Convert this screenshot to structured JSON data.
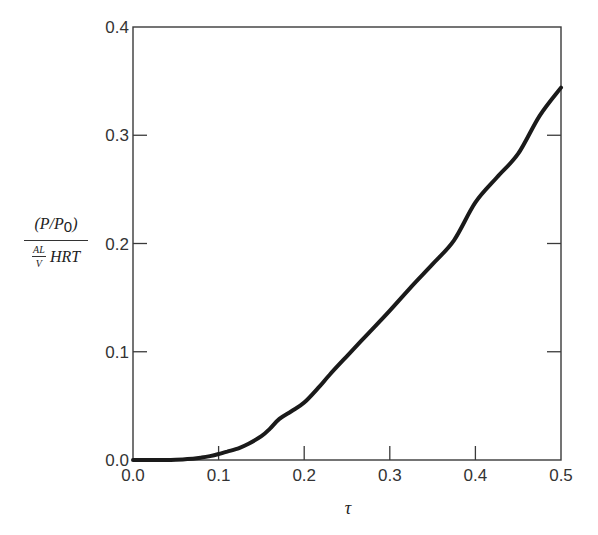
{
  "chart_data": {
    "type": "line",
    "title": "",
    "xlabel": "τ",
    "ylabel": {
      "numerator": "(P/P0)",
      "numerator_main": "(P/P",
      "numerator_sub": "0",
      "numerator_close": ")",
      "denominator_fraction_top": "AL",
      "denominator_fraction_bottom": "V",
      "denominator_rest": "HRT"
    },
    "xlim": [
      0.0,
      0.5
    ],
    "ylim": [
      0.0,
      0.4
    ],
    "xticks": [
      0.0,
      0.1,
      0.2,
      0.3,
      0.4,
      0.5
    ],
    "xtick_labels": [
      "0.0",
      "0.1",
      "0.2",
      "0.3",
      "0.4",
      "0.5"
    ],
    "yticks": [
      0.0,
      0.1,
      0.2,
      0.3,
      0.4
    ],
    "ytick_labels": [
      "0.0",
      "0.1",
      "0.2",
      "0.3",
      "0.4"
    ],
    "grid": false,
    "legend": "none",
    "series": [
      {
        "name": "P/P0 response",
        "x": [
          0.0,
          0.03,
          0.05,
          0.07,
          0.08,
          0.09,
          0.1,
          0.11,
          0.124,
          0.135,
          0.15,
          0.16,
          0.171,
          0.185,
          0.2,
          0.218,
          0.23,
          0.25,
          0.275,
          0.3,
          0.325,
          0.35,
          0.375,
          0.4,
          0.425,
          0.45,
          0.475,
          0.5
        ],
        "y": [
          0.0,
          0.0,
          0.0003,
          0.0012,
          0.0022,
          0.0036,
          0.0055,
          0.0078,
          0.011,
          0.015,
          0.022,
          0.029,
          0.038,
          0.045,
          0.053,
          0.068,
          0.079,
          0.096,
          0.117,
          0.138,
          0.16,
          0.181,
          0.203,
          0.238,
          0.261,
          0.283,
          0.318,
          0.344
        ]
      }
    ]
  }
}
